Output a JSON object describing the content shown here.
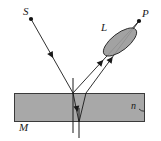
{
  "figure": {
    "background_color": "#ffffff",
    "stroke_color": "#1a1a1a",
    "slab_fill": "#a8a8a8",
    "lens_fill": "#9a9a9a",
    "width": 161,
    "height": 141
  },
  "labels": {
    "source": "S",
    "point": "P",
    "lens": "L",
    "mirror": "M",
    "index": "n"
  },
  "geometry": {
    "source_point": {
      "x": 31,
      "y": 19
    },
    "image_point": {
      "x": 139,
      "y": 21
    },
    "incidence_point": {
      "x": 73,
      "y": 93
    },
    "bottom_point": {
      "x": 79,
      "y": 122
    },
    "exit_point": {
      "x": 86,
      "y": 93
    },
    "slab": {
      "x": 14,
      "y": 93,
      "width": 131,
      "height": 29
    },
    "normal_line": {
      "x": 73,
      "y_top": 78,
      "y_bottom": 136
    },
    "normal_line_2": {
      "x": 79,
      "y_top": 93,
      "y_bottom": 138
    },
    "lens_ellipse": {
      "cx": 120,
      "cy": 42,
      "rx": 20,
      "ry": 8,
      "rotation": -38
    }
  },
  "rays": [
    {
      "name": "incident-ray",
      "from": "S",
      "to": "incidence-point",
      "arrow": "mid",
      "points": "31,19 73,93"
    },
    {
      "name": "reflected-ray-surface",
      "from": "incidence-point",
      "to": "P",
      "arrow": "mid",
      "points": "73,93 139,21"
    },
    {
      "name": "refracted-ray-down",
      "from": "incidence-point",
      "to": "bottom-point",
      "arrow": "mid",
      "points": "73,93 79,122"
    },
    {
      "name": "internal-reflected-ray-up",
      "from": "bottom-point",
      "to": "exit-point",
      "arrow": "none",
      "points": "79,122 86,93"
    },
    {
      "name": "emergent-ray",
      "from": "exit-point",
      "to": "P",
      "arrow": "mid",
      "points": "86,93 139,21"
    }
  ]
}
